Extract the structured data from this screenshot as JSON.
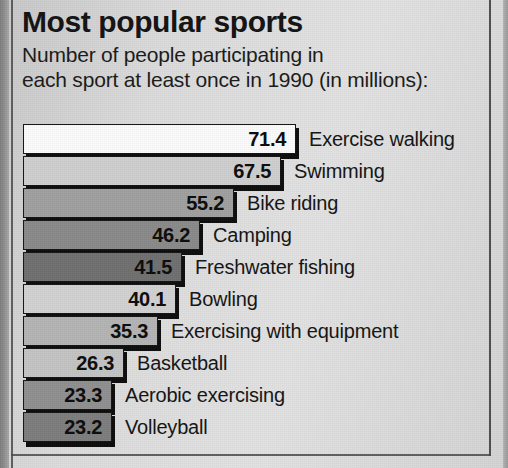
{
  "chart_data": {
    "type": "bar",
    "orientation": "horizontal",
    "title": "Most popular sports",
    "subtitle": "Number of people participating in\neach sport at least once in 1990 (in millions):",
    "xlabel": "",
    "ylabel": "",
    "units": "millions of people",
    "year": "1990",
    "grid": false,
    "legend": false,
    "xlim": [
      0,
      71.4
    ],
    "categories": [
      "Exercise walking",
      "Swimming",
      "Bike riding",
      "Camping",
      "Freshwater fishing",
      "Bowling",
      "Exercising with equipment",
      "Basketball",
      "Aerobic exercising",
      "Volleyball"
    ],
    "values": [
      71.4,
      67.5,
      55.2,
      46.2,
      41.5,
      40.1,
      35.3,
      26.3,
      23.3,
      23.2
    ],
    "value_labels": [
      "71.4",
      "67.5",
      "55.2",
      "46.2",
      "41.5",
      "40.1",
      "35.3",
      "26.3",
      "23.3",
      "23.2"
    ],
    "bar_colors": [
      "#fbfbfb",
      "#cfcfcf",
      "#a0a0a0",
      "#8a8a8a",
      "#707070",
      "#d2d2d2",
      "#b4b4b4",
      "#c4c4c4",
      "#909090",
      "#7d7d7d"
    ],
    "series": [
      {
        "name": "Participants 1990 (millions)",
        "values": [
          71.4,
          67.5,
          55.2,
          46.2,
          41.5,
          40.1,
          35.3,
          26.3,
          23.3,
          23.2
        ]
      }
    ]
  },
  "style": {
    "background": "#d9d9d9",
    "ink": "#131313",
    "border": "#4a4a4a"
  }
}
